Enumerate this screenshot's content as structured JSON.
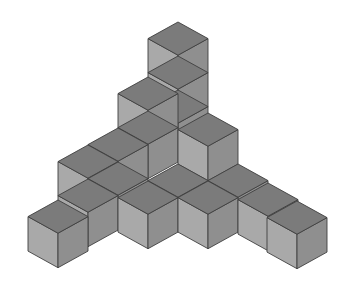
{
  "figure": {
    "colors": {
      "top_face": "#7b7b7b",
      "left_face": "#a9a9a9",
      "right_face": "#8f8f8f",
      "edge": "#3f3f3f",
      "background": "#ffffff"
    },
    "cube_count": 16
  }
}
